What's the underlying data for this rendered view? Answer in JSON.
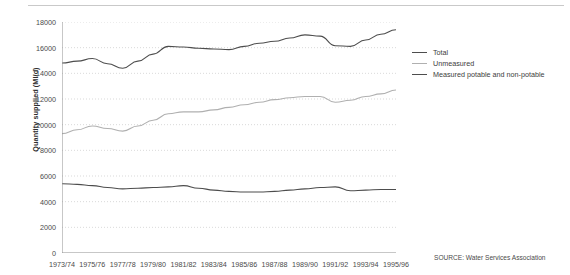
{
  "source_note": "SOURCE: Water Services Association",
  "axes": {
    "ylabel": "Quantity supplied (Ml/d)",
    "xlabel": "",
    "y_ticks": [
      "0",
      "2000",
      "4000",
      "6000",
      "8000",
      "10000",
      "12000",
      "14000",
      "16000",
      "18000"
    ],
    "x_ticks": [
      "1973/74",
      "1975/76",
      "1977/78",
      "1979/80",
      "1981/82",
      "1983/84",
      "1985/86",
      "1987/88",
      "1989/90",
      "1991/92",
      "1993/94",
      "1995/96"
    ]
  },
  "legend": {
    "position": "right",
    "items": [
      {
        "label": "Total",
        "color": "#4d4d4d"
      },
      {
        "label": "Unmeasured",
        "color": "#b0b0b0"
      },
      {
        "label": "Measured potable and non-potable",
        "color": "#4d4d4d"
      }
    ]
  },
  "colors": {
    "total": "#4d4d4d",
    "unmeasured": "#b0b0b0",
    "measured": "#4d4d4d",
    "grid": "#cfcfcf",
    "axis": "#8f8f8f",
    "text": "#3a3a3a"
  },
  "chart_data": {
    "type": "line",
    "title": "",
    "xlabel": "",
    "ylabel": "Quantity supplied (Ml/d)",
    "ylim": [
      0,
      18000
    ],
    "ytick_step": 2000,
    "grid": true,
    "legend_position": "right",
    "categories": [
      "1973/74",
      "1974/75",
      "1975/76",
      "1976/77",
      "1977/78",
      "1978/79",
      "1979/80",
      "1980/81",
      "1981/82",
      "1982/83",
      "1983/84",
      "1984/85",
      "1985/86",
      "1986/87",
      "1987/88",
      "1988/89",
      "1989/90",
      "1990/91",
      "1991/92",
      "1992/93",
      "1993/94",
      "1994/95",
      "1995/96"
    ],
    "series": [
      {
        "name": "Total",
        "color": "#4d4d4d",
        "values": [
          14800,
          14950,
          15150,
          14750,
          14400,
          14950,
          15500,
          16100,
          16050,
          15950,
          15900,
          15850,
          16100,
          16350,
          16500,
          16750,
          17000,
          16900,
          16150,
          16100,
          16600,
          17050,
          17400
        ]
      },
      {
        "name": "Unmeasured",
        "color": "#b0b0b0",
        "values": [
          9300,
          9600,
          9900,
          9700,
          9500,
          9900,
          10350,
          10850,
          11000,
          11000,
          11150,
          11350,
          11550,
          11750,
          11950,
          12100,
          12200,
          12200,
          11750,
          11900,
          12200,
          12400,
          12700
        ]
      },
      {
        "name": "Measured potable and non-potable",
        "color": "#4d4d4d",
        "values": [
          5400,
          5350,
          5250,
          5100,
          5000,
          5050,
          5100,
          5150,
          5250,
          5050,
          4900,
          4800,
          4750,
          4750,
          4800,
          4900,
          5000,
          5100,
          5150,
          4850,
          4900,
          4950,
          4950
        ]
      }
    ]
  }
}
